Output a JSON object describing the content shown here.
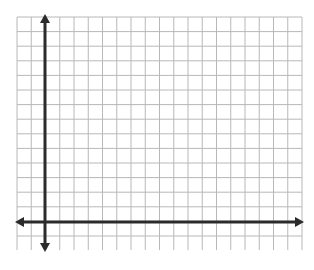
{
  "diagram": {
    "type": "coordinate-plane",
    "grid": {
      "columns": 20,
      "rows": 16,
      "left": 17,
      "top": 17,
      "right": 302,
      "bottom": 250,
      "cell_width": 14.25,
      "cell_height": 14.6,
      "line_color": "#b8b8b8"
    },
    "axes": {
      "color": "#2b2b2b",
      "y_axis_x": 45,
      "x_axis_y": 222,
      "y_axis_top": 14,
      "y_axis_bottom": 252,
      "x_axis_left": 15,
      "x_axis_right": 304,
      "arrows": [
        "up",
        "down",
        "left",
        "right"
      ]
    },
    "labels": []
  }
}
